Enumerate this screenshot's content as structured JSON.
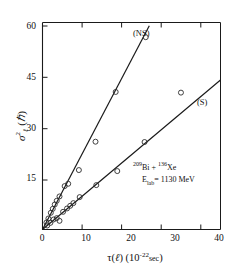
{
  "chart_data": {
    "type": "scatter",
    "title": "",
    "subtitle": "",
    "xlabel": "τ(ℓ) (10⁻²² sec)",
    "ylabel": "σ²ℓ (ħ)",
    "xlim": [
      0,
      45
    ],
    "ylim": [
      0,
      62
    ],
    "grid": false,
    "legend_position": "in-plot-line-labels",
    "xticks": [
      0,
      10,
      20,
      30,
      40
    ],
    "yticks": [
      15,
      30,
      45,
      60
    ],
    "xtick_labels": [
      "0",
      "10",
      "20",
      "30",
      "40"
    ],
    "ytick_labels": [
      "15",
      "30",
      "45",
      "60"
    ],
    "annotations": [
      {
        "id": "ns-line-label",
        "text": "(NS)",
        "x": 21.0,
        "y": 56.5
      },
      {
        "id": "s-line-label",
        "text": "(S)",
        "x": 40.5,
        "y": 38.0
      },
      {
        "id": "reaction-line-1",
        "text": "209Bi + 136Xe",
        "x": 24.0,
        "y": 19.5
      },
      {
        "id": "reaction-line-2",
        "text": "Elab = 1130 MeV",
        "x": 24.0,
        "y": 16.0
      }
    ],
    "reaction": {
      "projectile_mass": "209",
      "projectile_symbol": "Bi",
      "plus": "+",
      "target_mass": "136",
      "target_symbol": "Xe",
      "energy_symbol": "E",
      "energy_subscript": "lab",
      "energy_equals": "=",
      "energy_value": "1130",
      "energy_unit": "MeV"
    },
    "series": [
      {
        "name": "(NS)",
        "kind": "scatter+fit",
        "marker": "open-circle",
        "fit_type": "linear",
        "fit_slope": 2.26,
        "fit_intercept": 0.0,
        "fit_x_range": [
          0.0,
          27.0
        ],
        "points": [
          {
            "x": 1.0,
            "y": 2.1
          },
          {
            "x": 1.5,
            "y": 3.3
          },
          {
            "x": 2.1,
            "y": 5.0
          },
          {
            "x": 2.6,
            "y": 6.2
          },
          {
            "x": 3.1,
            "y": 7.5
          },
          {
            "x": 3.6,
            "y": 8.6
          },
          {
            "x": 4.3,
            "y": 9.9
          },
          {
            "x": 5.6,
            "y": 13.0
          },
          {
            "x": 6.5,
            "y": 13.7
          },
          {
            "x": 9.2,
            "y": 17.8
          },
          {
            "x": 13.4,
            "y": 26.3
          },
          {
            "x": 18.5,
            "y": 41.2
          },
          {
            "x": 26.1,
            "y": 57.6
          }
        ]
      },
      {
        "name": "(S)",
        "kind": "scatter+fit",
        "marker": "open-circle",
        "fit_type": "linear",
        "fit_slope": 0.995,
        "fit_intercept": 0.0,
        "fit_x_range": [
          0.0,
          45.0
        ],
        "points": [
          {
            "x": 1.2,
            "y": 1.2
          },
          {
            "x": 2.0,
            "y": 2.0
          },
          {
            "x": 2.8,
            "y": 3.0
          },
          {
            "x": 3.6,
            "y": 3.4
          },
          {
            "x": 4.3,
            "y": 2.6
          },
          {
            "x": 5.2,
            "y": 5.3
          },
          {
            "x": 6.2,
            "y": 6.3
          },
          {
            "x": 7.0,
            "y": 7.1
          },
          {
            "x": 7.8,
            "y": 7.9
          },
          {
            "x": 9.4,
            "y": 9.7
          },
          {
            "x": 13.6,
            "y": 13.3
          },
          {
            "x": 18.9,
            "y": 17.5
          },
          {
            "x": 25.8,
            "y": 26.2
          },
          {
            "x": 35.0,
            "y": 41.0
          }
        ]
      }
    ]
  },
  "axes": {
    "frame_color": "#1a1a1a",
    "marker_color": "#2b2b2b",
    "line_color": "#1a1a1a"
  }
}
